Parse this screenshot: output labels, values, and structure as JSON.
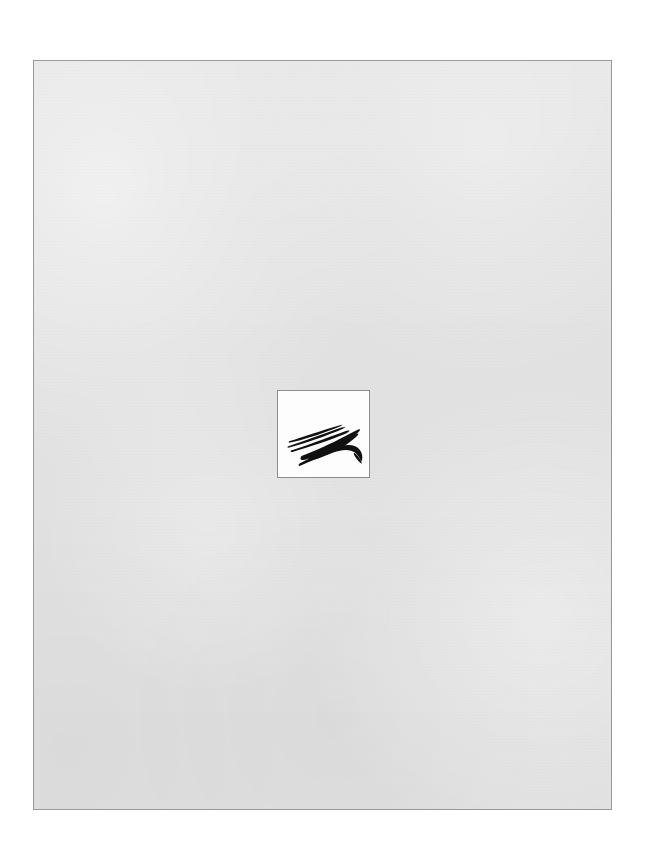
{
  "document": {
    "kind": "scanned-page",
    "page_background_color": "#e2e2e2",
    "page_border_color": "#9a9a9a",
    "canvas_background_color": "#ffffff",
    "body_text": "",
    "header_text": "",
    "footer_text": "",
    "page_number": ""
  },
  "logo": {
    "name": "calligraphic-brushstroke-mark",
    "description": "Stylized black calligraphic brush-stroke emblem: tapered diagonal strokes sweeping up to the right, converging into a dense mass, with a bold crescent swoosh curving beneath to a point at the right.",
    "ink_color": "#111111",
    "plate_background_color": "#fdfdfd",
    "plate_border_color": "#8d8d8d",
    "caption": ""
  }
}
